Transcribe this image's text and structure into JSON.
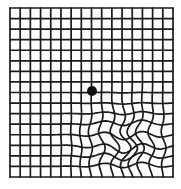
{
  "grid": {
    "columns": 16,
    "rows": 16,
    "left": 10,
    "top": 8,
    "right": 173,
    "bottom": 177,
    "line_color": "#1a1a1a",
    "background": "#ffffff"
  },
  "fixation_dot": {
    "cx": 92,
    "cy": 91,
    "r": 5,
    "color": "#111111"
  },
  "distortion_region": "lower-right quadrant"
}
